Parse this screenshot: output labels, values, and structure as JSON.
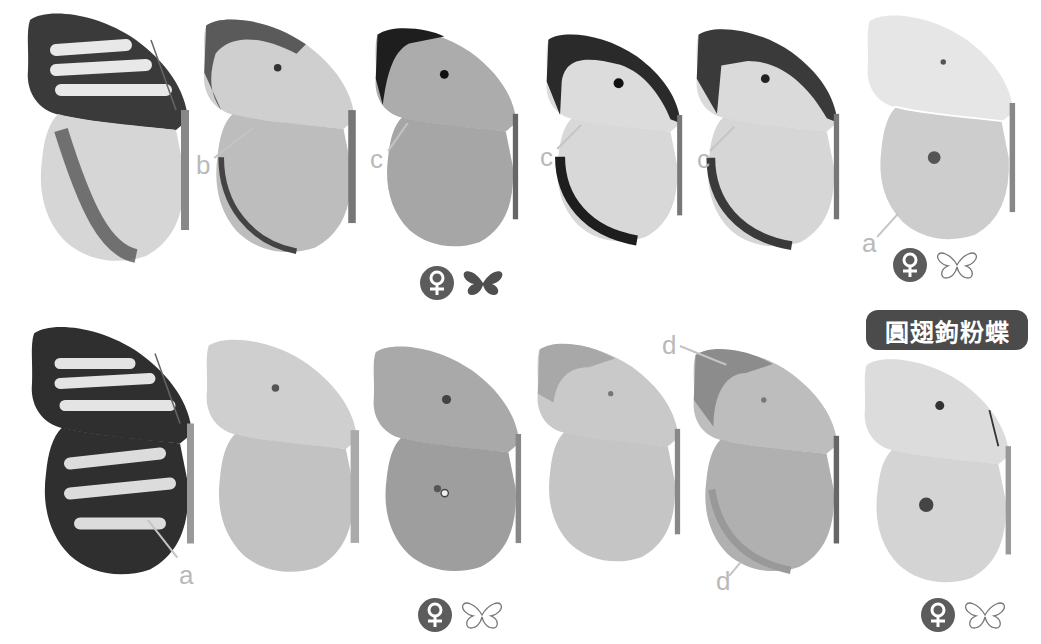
{
  "title_badge": {
    "text": "圓翅鉤粉蝶"
  },
  "rows": [
    {
      "specimens": [
        {
          "id": "r1-s1",
          "tone": "dark-veined",
          "labels": []
        },
        {
          "id": "r1-s2",
          "tone": "medium",
          "labels": [
            "b"
          ]
        },
        {
          "id": "r1-s3",
          "tone": "gray",
          "labels": [
            "c"
          ]
        },
        {
          "id": "r1-s4",
          "tone": "light-dark-border",
          "labels": [
            "c"
          ]
        },
        {
          "id": "r1-s5",
          "tone": "light-dark-apex",
          "labels": [
            "c"
          ]
        },
        {
          "id": "r1-s6",
          "tone": "pale-scalloped",
          "labels": [
            "a"
          ]
        }
      ],
      "symbols": [
        {
          "sex": "female",
          "sex_glyph": "♀",
          "view": "upperside",
          "view_icon": "filled-butterfly"
        },
        {
          "sex": "female",
          "sex_glyph": "♀",
          "view": "underside",
          "view_icon": "outline-butterfly"
        }
      ]
    },
    {
      "specimens": [
        {
          "id": "r2-s1",
          "tone": "dark-veined",
          "labels": [
            "a"
          ]
        },
        {
          "id": "r2-s2",
          "tone": "pale-mottled",
          "labels": []
        },
        {
          "id": "r2-s3",
          "tone": "gray-mottled",
          "labels": []
        },
        {
          "id": "r2-s4",
          "tone": "pale",
          "labels": []
        },
        {
          "id": "r2-s5",
          "tone": "medium-apex",
          "labels": [
            "d",
            "d"
          ]
        },
        {
          "id": "r2-s6",
          "tone": "pale-spot",
          "labels": []
        }
      ],
      "symbols": [
        {
          "sex": "female",
          "sex_glyph": "♀",
          "view": "underside",
          "view_icon": "outline-butterfly"
        },
        {
          "sex": "female",
          "sex_glyph": "♀",
          "view": "underside",
          "view_icon": "outline-butterfly"
        }
      ]
    }
  ],
  "annotation_letters": [
    "a",
    "b",
    "c",
    "d"
  ],
  "colors": {
    "badge_bg": "#4b4b4b",
    "badge_text": "#ffffff",
    "label": "#b9b9b9",
    "symbol": "#5c5c5c"
  }
}
